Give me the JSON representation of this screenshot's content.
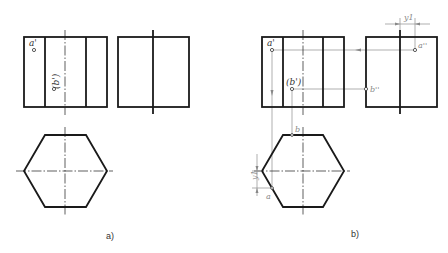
{
  "figure": {
    "panels": [
      {
        "caption": "a)",
        "front_view": {
          "x": 24,
          "y": 37,
          "w": 83,
          "h": 70,
          "inner_lines_x": [
            45,
            86
          ],
          "centerline_x": 65
        },
        "side_view": {
          "x": 118,
          "y": 37,
          "w": 71,
          "h": 70,
          "centerline_x": 153
        },
        "top_view_hexagon": {
          "cx": 65,
          "cy": 171,
          "left_x": 24,
          "right_x": 107,
          "top_y": 135,
          "bottom_y": 207,
          "flat_x1": 45,
          "flat_x2": 86
        },
        "labels": {
          "a_prime": "a'",
          "b_prime": "(b')"
        }
      },
      {
        "caption": "b)",
        "front_view": {
          "x": 262,
          "y": 37,
          "w": 82,
          "h": 70,
          "inner_lines_x": [
            283,
            323
          ],
          "centerline_x": 303
        },
        "side_view": {
          "x": 366,
          "y": 37,
          "w": 71,
          "h": 70,
          "centerline_x": 400
        },
        "top_view_hexagon": {
          "cx": 303,
          "cy": 171,
          "left_x": 262,
          "right_x": 344,
          "top_y": 135,
          "bottom_y": 207,
          "flat_x1": 283,
          "flat_x2": 323
        },
        "labels": {
          "a_prime": "a'",
          "b_prime": "(b')",
          "a_double_prime": "a''",
          "b_double_prime": "b''",
          "a": "a",
          "b": "b",
          "dim_y1_top": "y1",
          "dim_y1_left": "y1"
        }
      }
    ]
  }
}
